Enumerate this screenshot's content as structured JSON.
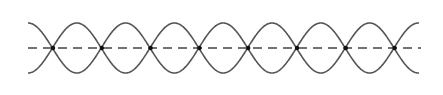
{
  "diagram": {
    "title": "",
    "colors": {
      "wave": "#555555",
      "axis": "#444444",
      "node": "#111111",
      "background": "#ffffff"
    },
    "geometry": {
      "x_start": 28,
      "x_end": 419,
      "center_y": 48,
      "amplitude": 25,
      "half_wavelength": 48.8,
      "node_count": 8
    },
    "nodes_x": [
      53,
      101.8,
      150.6,
      199.4,
      248.2,
      297,
      345.8,
      394.6
    ]
  }
}
